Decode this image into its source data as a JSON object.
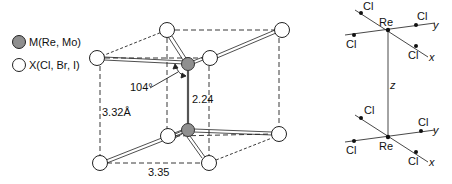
{
  "legend": {
    "metal_label": "M(Re, Mo)",
    "halide_label": "X(Cl, Br, I)",
    "metal_color": "#8f8f8f",
    "halide_color": "#ffffff"
  },
  "structure": {
    "angle_label": "104°",
    "mm_distance": "2.24",
    "xx_vertical": "3.32Å",
    "xx_horizontal": "3.35"
  },
  "orbital_frame": {
    "metal_top": "Re",
    "metal_bottom": "Re",
    "ligand": "Cl",
    "axis_x": "x",
    "axis_y": "y",
    "axis_z": "z"
  }
}
